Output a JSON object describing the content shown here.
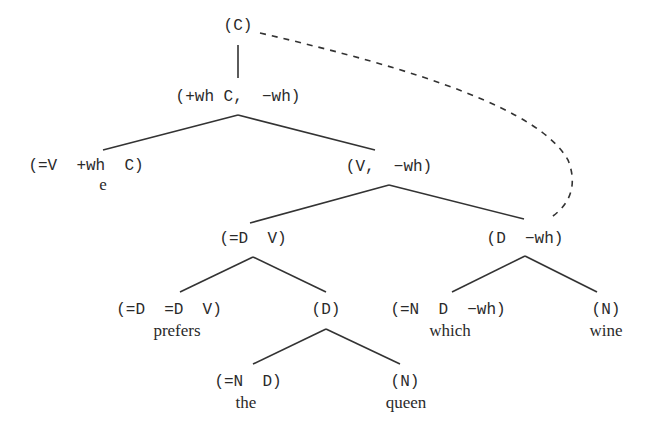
{
  "diagram": {
    "type": "syntax-tree",
    "nodes": [
      {
        "id": "c_root",
        "label": "(C)"
      },
      {
        "id": "c_bar",
        "label": "(+wh C,  −wh)"
      },
      {
        "id": "c_head",
        "label": "(=V  +wh  C)",
        "word": "e"
      },
      {
        "id": "v_wh",
        "label": "(V,  −wh)"
      },
      {
        "id": "dv",
        "label": "(=D  V)"
      },
      {
        "id": "d_wh",
        "label": "(D  −wh)"
      },
      {
        "id": "ddv",
        "label": "(=D  =D  V)",
        "word": "prefers"
      },
      {
        "id": "d",
        "label": "(D)"
      },
      {
        "id": "ndwh",
        "label": "(=N  D  −wh)",
        "word": "which"
      },
      {
        "id": "n_wine",
        "label": "(N)",
        "word": "wine"
      },
      {
        "id": "nd",
        "label": "(=N  D)",
        "word": "the"
      },
      {
        "id": "n_queen",
        "label": "(N)",
        "word": "queen"
      }
    ],
    "edges": [
      [
        "c_root",
        "c_bar"
      ],
      [
        "c_bar",
        "c_head"
      ],
      [
        "c_bar",
        "v_wh"
      ],
      [
        "v_wh",
        "dv"
      ],
      [
        "v_wh",
        "d_wh"
      ],
      [
        "dv",
        "ddv"
      ],
      [
        "dv",
        "d"
      ],
      [
        "d_wh",
        "ndwh"
      ],
      [
        "d_wh",
        "n_wine"
      ],
      [
        "d",
        "nd"
      ],
      [
        "d",
        "n_queen"
      ]
    ],
    "movement_link": {
      "from": "c_root",
      "to": "d_wh",
      "style": "dashed"
    }
  }
}
